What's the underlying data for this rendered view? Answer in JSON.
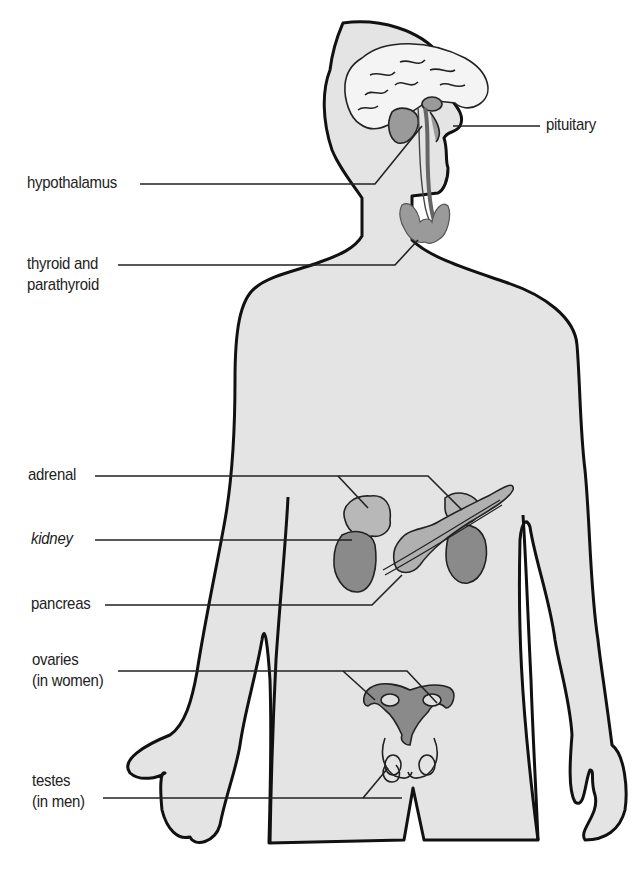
{
  "diagram": {
    "colors": {
      "body_fill": "#e4e4e4",
      "outline": "#111111",
      "organ_dark": "#8a8a8a",
      "organ_mid": "#a8a8a8",
      "brain_fill": "#f2f2f2",
      "leader_line": "#222222"
    },
    "labels": {
      "pituitary": {
        "line1": "pituitary"
      },
      "hypothalamus": {
        "line1": "hypothalamus"
      },
      "thyroid": {
        "line1": "thyroid and",
        "line2": "parathyroid"
      },
      "adrenal": {
        "line1": "adrenal"
      },
      "kidney": {
        "line1": "kidney"
      },
      "pancreas": {
        "line1": "pancreas"
      },
      "ovaries": {
        "line1": "ovaries",
        "line2": "(in women)"
      },
      "testes": {
        "line1": "testes",
        "line2": "(in men)"
      }
    }
  }
}
